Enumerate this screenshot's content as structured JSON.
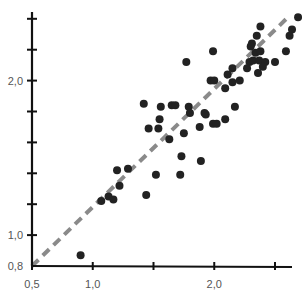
{
  "chart_data": {
    "type": "scatter",
    "title": "",
    "xlabel": "",
    "ylabel": "",
    "xlim": [
      0.5,
      2.6
    ],
    "ylim": [
      0.8,
      2.4
    ],
    "grid": false,
    "legend": null,
    "x_ticks": [
      0.5,
      1.0,
      1.5,
      2.0,
      2.5
    ],
    "x_tick_labels": [
      "0,5",
      "1,0",
      "",
      "2,0",
      ""
    ],
    "y_ticks": [
      0.8,
      1.0,
      1.2,
      1.4,
      1.6,
      1.8,
      2.0,
      2.2,
      2.4
    ],
    "y_tick_labels": [
      "0,8",
      "1,0",
      "",
      "",
      "",
      "",
      "2,0",
      "",
      ""
    ],
    "reference_line": {
      "type": "identity",
      "style": "dashed",
      "color": "#8a8a8a",
      "from": [
        0.5,
        0.8
      ],
      "to": [
        2.62,
        2.42
      ]
    },
    "marker_color": "#222222",
    "series": [
      {
        "name": "points",
        "points": [
          [
            0.9,
            0.87
          ],
          [
            1.07,
            1.22
          ],
          [
            1.13,
            1.25
          ],
          [
            1.17,
            1.23
          ],
          [
            1.2,
            1.42
          ],
          [
            1.22,
            1.32
          ],
          [
            1.29,
            1.43
          ],
          [
            1.44,
            1.26
          ],
          [
            1.42,
            1.85
          ],
          [
            1.56,
            1.83
          ],
          [
            1.65,
            1.84
          ],
          [
            1.55,
            1.75
          ],
          [
            1.46,
            1.69
          ],
          [
            1.54,
            1.69
          ],
          [
            1.63,
            1.62
          ],
          [
            1.52,
            1.39
          ],
          [
            1.72,
            1.39
          ],
          [
            1.73,
            1.51
          ],
          [
            1.89,
            1.48
          ],
          [
            1.68,
            1.84
          ],
          [
            1.79,
            1.83
          ],
          [
            1.8,
            1.79
          ],
          [
            1.93,
            1.78
          ],
          [
            1.88,
            1.7
          ],
          [
            1.99,
            1.72
          ],
          [
            1.75,
            1.66
          ],
          [
            1.77,
            2.12
          ],
          [
            1.99,
            2.19
          ],
          [
            1.97,
            2.0
          ],
          [
            2.0,
            2.0
          ],
          [
            2.15,
            2.08
          ],
          [
            2.29,
            2.12
          ],
          [
            2.27,
            2.08
          ],
          [
            2.11,
            2.04
          ],
          [
            2.09,
            1.95
          ],
          [
            2.15,
            1.99
          ],
          [
            2.21,
            2.0
          ],
          [
            1.92,
            1.79
          ],
          [
            2.17,
            1.83
          ],
          [
            2.09,
            1.75
          ],
          [
            2.69,
            2.41
          ],
          [
            2.64,
            2.33
          ],
          [
            2.62,
            2.29
          ],
          [
            2.38,
            2.35
          ],
          [
            2.35,
            2.29
          ],
          [
            2.31,
            2.24
          ],
          [
            2.3,
            2.22
          ],
          [
            2.34,
            2.18
          ],
          [
            2.38,
            2.19
          ],
          [
            2.32,
            2.13
          ],
          [
            2.37,
            2.13
          ],
          [
            2.42,
            2.12
          ],
          [
            2.5,
            2.12
          ],
          [
            2.59,
            2.19
          ],
          [
            2.4,
            2.09
          ],
          [
            2.36,
            2.05
          ],
          [
            2.02,
            1.72
          ]
        ]
      }
    ]
  },
  "layout": {
    "origin_px": [
      32,
      266
    ],
    "x_px_per_unit": 121.5,
    "y_px_per_unit": 154.5,
    "x_axis_end_px": 292,
    "y_axis_top_px": 12,
    "point_radius": 4
  }
}
